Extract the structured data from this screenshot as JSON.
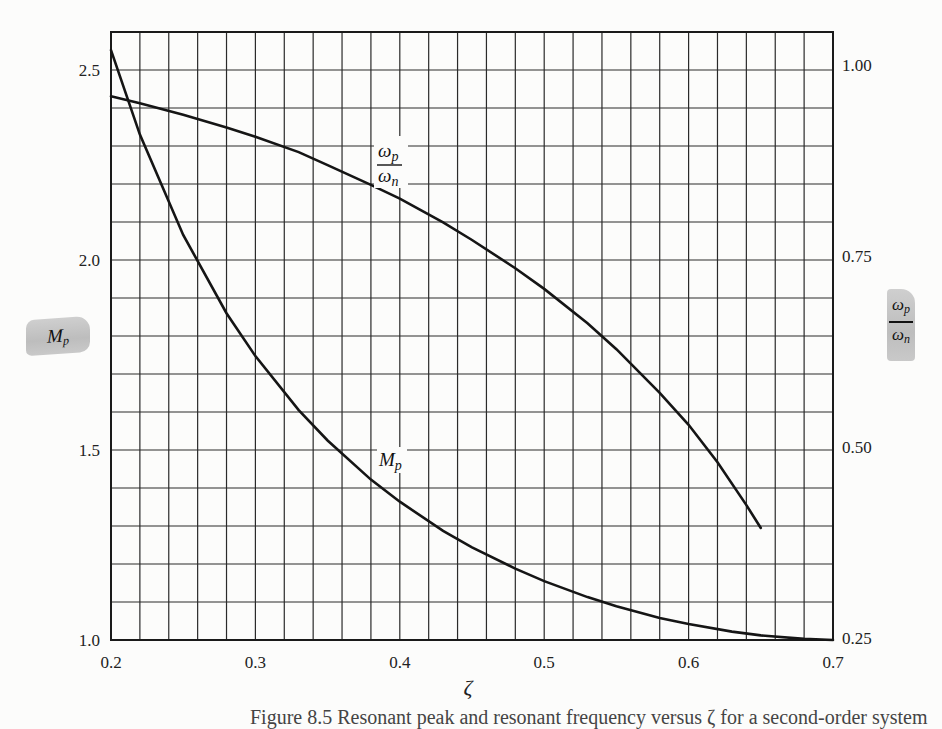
{
  "chart_data": {
    "type": "line",
    "title": "",
    "xlabel": "ζ",
    "ylabel_left": "M_p",
    "ylabel_right": "ω_p / ω_n",
    "xlim": [
      0.2,
      0.7
    ],
    "ylim_left": [
      1.0,
      2.6
    ],
    "ylim_right": [
      0.25,
      1.0
    ],
    "grid": true,
    "grid_x_step": 0.02,
    "grid_y_step_left": 0.1,
    "x_ticks": [
      "0.2",
      "0.3",
      "0.4",
      "0.5",
      "0.6",
      "0.7"
    ],
    "x_tick_values": [
      0.2,
      0.3,
      0.4,
      0.5,
      0.6,
      0.7
    ],
    "y_ticks_left": [
      "1.0",
      "1.5",
      "2.0",
      "2.5"
    ],
    "y_tick_values_left": [
      1.0,
      1.5,
      2.0,
      2.5
    ],
    "y_ticks_right": [
      "0.25",
      "0.50",
      "0.75",
      "1.00"
    ],
    "y_tick_values_right": [
      0.25,
      0.5,
      0.75,
      1.0
    ],
    "series": [
      {
        "name": "M_p",
        "axis": "left",
        "x": [
          0.2,
          0.22,
          0.25,
          0.28,
          0.3,
          0.33,
          0.35,
          0.38,
          0.4,
          0.43,
          0.45,
          0.48,
          0.5,
          0.53,
          0.55,
          0.58,
          0.6,
          0.63,
          0.65,
          0.68,
          0.7
        ],
        "values": [
          2.552,
          2.33,
          2.066,
          1.86,
          1.747,
          1.605,
          1.525,
          1.422,
          1.364,
          1.287,
          1.244,
          1.188,
          1.155,
          1.113,
          1.089,
          1.058,
          1.042,
          1.022,
          1.012,
          1.003,
          1.0
        ]
      },
      {
        "name": "ω_p / ω_n",
        "axis": "right",
        "x": [
          0.2,
          0.22,
          0.25,
          0.28,
          0.3,
          0.33,
          0.35,
          0.38,
          0.4,
          0.43,
          0.45,
          0.48,
          0.5,
          0.53,
          0.55,
          0.58,
          0.6,
          0.62,
          0.64,
          0.65
        ],
        "values": [
          0.959,
          0.95,
          0.935,
          0.918,
          0.906,
          0.886,
          0.869,
          0.843,
          0.825,
          0.794,
          0.771,
          0.734,
          0.707,
          0.662,
          0.628,
          0.571,
          0.529,
          0.48,
          0.424,
          0.394
        ]
      }
    ],
    "annotations": [
      {
        "text": "ω_p / ω_n",
        "x": 0.392,
        "y_left": 2.28
      },
      {
        "text": "M_p",
        "x": 0.395,
        "y_left": 1.47
      }
    ]
  },
  "labels": {
    "left_axis_tab": "M",
    "left_axis_tab_sub": "p",
    "right_axis_tab_num": "ω",
    "right_axis_tab_num_sub": "p",
    "right_axis_tab_den": "ω",
    "right_axis_tab_den_sub": "n",
    "x_axis_symbol": "ζ",
    "curve_label_wp_num": "ω",
    "curve_label_wp_num_sub": "p",
    "curve_label_wp_den": "ω",
    "curve_label_wp_den_sub": "n",
    "curve_label_mp": "M",
    "curve_label_mp_sub": "p",
    "caption": "Figure 8.5   Resonant peak and resonant frequency versus ζ for a second-order system"
  },
  "colors": {
    "background": "#fcfcfb",
    "grid": "#2a2a2a",
    "curve": "#151515",
    "tab": "#c4c4c4"
  }
}
